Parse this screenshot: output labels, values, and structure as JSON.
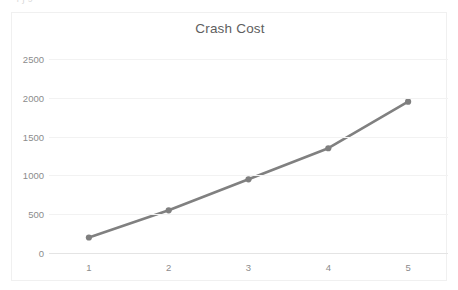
{
  "document": {
    "clipped_top_text": "—  ı                                ʃ ɔ"
  },
  "chart_data": {
    "type": "line",
    "title": "Crash Cost",
    "subtitle": "",
    "xlabel": "",
    "ylabel": "",
    "x": [
      1,
      2,
      3,
      4,
      5
    ],
    "categories": [
      "1",
      "2",
      "3",
      "4",
      "5"
    ],
    "values": [
      200,
      550,
      950,
      1350,
      1950
    ],
    "series": [
      {
        "name": "Crash Cost",
        "values": [
          200,
          550,
          950,
          1350,
          1950
        ]
      }
    ],
    "ylim": [
      0,
      2500
    ],
    "y_ticks": [
      0,
      500,
      1000,
      1500,
      2000,
      2500
    ],
    "y_tick_labels": [
      "0",
      "500",
      "1000",
      "1500",
      "2000",
      "2500"
    ],
    "x_tick_labels": [
      "1",
      "2",
      "3",
      "4",
      "5"
    ],
    "grid": true,
    "grid_axis": "y",
    "legend": false,
    "legend_position": "none",
    "markers": true,
    "annotations": [],
    "colors": {
      "series_line": "#808080",
      "marker": "#7f7f7f",
      "gridline": "#f2f2f2",
      "axis_line": "#e4e4e4",
      "title_text": "#5e5e5e",
      "tick_text": "#8c8c8c",
      "plot_background": "#ffffff",
      "frame_border": "#f0f0f0"
    }
  }
}
